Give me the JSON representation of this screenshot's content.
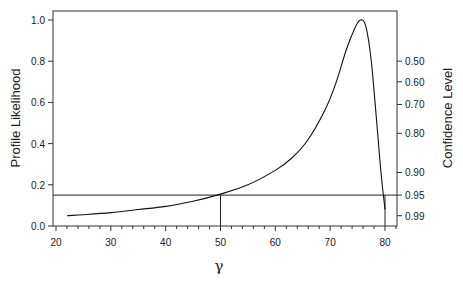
{
  "chart_data": {
    "type": "line",
    "title": "",
    "xlabel": "γ",
    "ylabel": "Profile Likelihood",
    "y2label": "Confidence Level",
    "xlim": [
      20,
      82
    ],
    "ylim": [
      0,
      1.05
    ],
    "xticks": [
      20,
      30,
      40,
      50,
      60,
      70,
      80
    ],
    "yticks": [
      0.0,
      0.2,
      0.4,
      0.6,
      0.8,
      1.0
    ],
    "ytick_labels": [
      "0.0",
      "0.2",
      "0.4",
      "0.6",
      "0.8",
      "1.0"
    ],
    "y2ticks": [
      {
        "label": "0.50",
        "y": 0.8
      },
      {
        "label": "0.60",
        "y": 0.7
      },
      {
        "label": "0.70",
        "y": 0.59
      },
      {
        "label": "0.80",
        "y": 0.45
      },
      {
        "label": "0.90",
        "y": 0.26
      },
      {
        "label": "0.95",
        "y": 0.15
      },
      {
        "label": "0.99",
        "y": 0.05
      }
    ],
    "grid": false,
    "series": [
      {
        "name": "Profile Likelihood",
        "x": [
          22,
          25,
          30,
          35,
          40,
          45,
          50,
          55,
          60,
          63,
          66,
          69,
          71,
          73,
          74.5,
          75.5,
          76.5,
          77.5,
          78.5,
          79.3,
          80
        ],
        "y": [
          0.05,
          0.055,
          0.065,
          0.08,
          0.095,
          0.12,
          0.155,
          0.2,
          0.27,
          0.33,
          0.42,
          0.56,
          0.69,
          0.86,
          0.96,
          1.0,
          0.97,
          0.8,
          0.5,
          0.25,
          0.08
        ]
      }
    ],
    "annotations": [
      {
        "type": "hline",
        "y": 0.15,
        "label": "95% confidence cutoff"
      },
      {
        "type": "vline",
        "x": 50,
        "y_top": 0.15,
        "label": "lower bound"
      },
      {
        "type": "vline",
        "x": 80,
        "y_top": 0.15,
        "label": "upper bound"
      }
    ]
  },
  "labels": {
    "xlabel": "γ",
    "ylabel": "Profile Likelihood",
    "y2label": "Confidence Level"
  }
}
